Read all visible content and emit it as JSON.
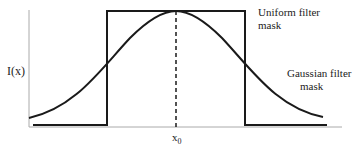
{
  "diagram": {
    "y_axis_label": "I(x)",
    "x_marker_label": "x",
    "x_marker_subscript": "0",
    "uniform_label_line1": "Uniform filter",
    "uniform_label_line2": "mask",
    "gaussian_label_line1": "Gaussian filter",
    "gaussian_label_line2": "mask",
    "colors": {
      "curve": "#1a1a1a",
      "axis": "#9a9a9a",
      "text": "#222222"
    }
  }
}
